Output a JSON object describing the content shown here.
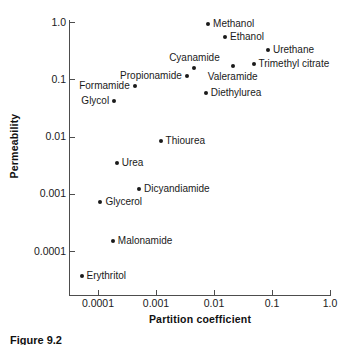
{
  "chart_data": {
    "type": "scatter",
    "title": "",
    "xlabel": "Partition coefficient",
    "ylabel": "Permeability",
    "xscale": "log",
    "yscale": "log",
    "xlim": [
      4e-05,
      1.0
    ],
    "ylim": [
      3e-05,
      1.0
    ],
    "grid": false,
    "legend": "none",
    "xticks": [
      "0.0001",
      "0.001",
      "0.01",
      "0.1",
      "1.0"
    ],
    "xtick_values": [
      0.0001,
      0.001,
      0.01,
      0.1,
      1.0
    ],
    "yticks": [
      "1.0",
      "0.1",
      "0.01",
      "0.001",
      "0.0001"
    ],
    "ytick_values": [
      1.0,
      0.1,
      0.01,
      0.001,
      0.0001
    ],
    "points": [
      {
        "label": "Methanol",
        "x": 0.0079,
        "y": 0.92,
        "label_pos": "right"
      },
      {
        "label": "Ethanol",
        "x": 0.0155,
        "y": 0.55,
        "label_pos": "right"
      },
      {
        "label": "Urethane",
        "x": 0.085,
        "y": 0.33,
        "label_pos": "right"
      },
      {
        "label": "Trimethyl citrate",
        "x": 0.048,
        "y": 0.185,
        "label_pos": "right"
      },
      {
        "label": "Valeramide",
        "x": 0.021,
        "y": 0.17,
        "label_pos": "below"
      },
      {
        "label": "Cyanamide",
        "x": 0.0046,
        "y": 0.155,
        "label_pos": "above"
      },
      {
        "label": "Propionamide",
        "x": 0.0034,
        "y": 0.115,
        "label_pos": "left"
      },
      {
        "label": "Formamide",
        "x": 0.00043,
        "y": 0.076,
        "label_pos": "left"
      },
      {
        "label": "Glycol",
        "x": 0.00019,
        "y": 0.042,
        "label_pos": "left"
      },
      {
        "label": "Diethylurea",
        "x": 0.0072,
        "y": 0.057,
        "label_pos": "right"
      },
      {
        "label": "Thiourea",
        "x": 0.0012,
        "y": 0.0084,
        "label_pos": "right"
      },
      {
        "label": "Urea",
        "x": 0.00021,
        "y": 0.0035,
        "label_pos": "right"
      },
      {
        "label": "Dicyandiamide",
        "x": 0.00051,
        "y": 0.0012,
        "label_pos": "right"
      },
      {
        "label": "Glycerol",
        "x": 0.00011,
        "y": 0.00072,
        "label_pos": "right"
      },
      {
        "label": "Malonamide",
        "x": 0.00018,
        "y": 0.00015,
        "label_pos": "right"
      },
      {
        "label": "Erythritol",
        "x": 5.2e-05,
        "y": 3.7e-05,
        "label_pos": "right"
      }
    ]
  },
  "caption": {
    "text": "Figure 9.2"
  },
  "colors": {
    "marker": "#1a1a1a",
    "axis": "#4d4d4d",
    "text": "#1a1a1a",
    "background": "#ffffff"
  }
}
